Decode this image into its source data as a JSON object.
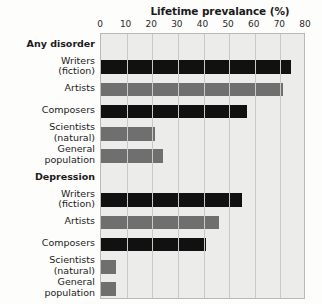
{
  "chart_data": {
    "type": "bar",
    "orientation": "horizontal",
    "title": "Lifetime prevalance (%)",
    "xlabel": "Lifetime prevalance (%)",
    "ylabel": "",
    "xlim": [
      0,
      80
    ],
    "xticks": [
      0,
      10,
      20,
      30,
      40,
      50,
      60,
      70,
      80
    ],
    "grid": true,
    "legend": "none",
    "groups": [
      {
        "name": "Any disorder",
        "categories": [
          "Writers\n(fiction)",
          "Artists",
          "Composers",
          "Scientists\n(natural)",
          "General\npopulation"
        ],
        "values": [
          74,
          71,
          57,
          21,
          24
        ],
        "colors": [
          "#111111",
          "#6f6f6f",
          "#111111",
          "#6f6f6f",
          "#6f6f6f"
        ]
      },
      {
        "name": "Depression",
        "categories": [
          "Writers\n(fiction)",
          "Artists",
          "Composers",
          "Scientists\n(natural)",
          "General\npopulation"
        ],
        "values": [
          55,
          46,
          41,
          6,
          6
        ],
        "colors": [
          "#111111",
          "#6f6f6f",
          "#111111",
          "#6f6f6f",
          "#6f6f6f"
        ]
      }
    ],
    "categories": [
      "Any disorder",
      "Writers (fiction)",
      "Artists",
      "Composers",
      "Scientists (natural)",
      "General population",
      "Depression",
      "Writers (fiction)",
      "Artists",
      "Composers",
      "Scientists (natural)",
      "General population"
    ],
    "values": [
      null,
      74,
      71,
      57,
      21,
      24,
      null,
      55,
      46,
      41,
      6,
      6
    ]
  },
  "colors": {
    "dark_bar": "#111111",
    "mid_bar": "#6f6f6f",
    "plot_background": "#ececeb",
    "gridline": "#c9c9c7",
    "page_background": "#fdfdfb",
    "text": "#1b1b1b"
  },
  "axis": {
    "ticks": [
      "0",
      "10",
      "20",
      "30",
      "40",
      "50",
      "60",
      "70",
      "80"
    ]
  },
  "labels": {
    "title": "Lifetime prevalance (%)",
    "group_any_disorder": "Any disorder",
    "group_depression": "Depression",
    "writers": "Writers\n(fiction)",
    "artists": "Artists",
    "composers": "Composers",
    "scientists": "Scientists\n(natural)",
    "general_population": "General\npopulation"
  }
}
